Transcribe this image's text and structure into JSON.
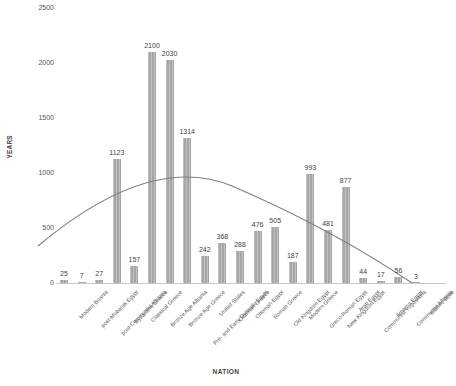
{
  "chart_data": {
    "type": "bar",
    "title": "",
    "xlabel": "NATION",
    "ylabel": "YEARS",
    "ylim": [
      0,
      2500
    ],
    "yticks": [
      0,
      500,
      1000,
      1500,
      2000,
      2500
    ],
    "grid": false,
    "legend": null,
    "bar_color": "#a6a6a6",
    "trendline": {
      "present": true,
      "shape": "downward-parabola",
      "color": "#7f7f7f",
      "description": "polynomial trendline rising from left, peaking near Ottoman Egypt, descending to baseline near Communist Albania"
    },
    "categories": [
      "Modern Bosnia",
      "post-Mubarak Egypt",
      "post-Communist Albania",
      "Byzantine Greece",
      "Classical Greece",
      "Bronze Age Albania",
      "Bronze Age Greece",
      "Pre- and Early Dynastic Egypt",
      "United States",
      "Ottoman Greece",
      "Ottoman Egypt",
      "Roman Greece",
      "Old Kingdom Egypt",
      "Modern Greece",
      "Greco-Roman Egypt",
      "New Kingdom Egypt",
      "Arab Egypt",
      "Communist Yugoslavia",
      "Amarna Egypt",
      "Communist Albania",
      "Islamic State"
    ],
    "values": [
      25,
      7,
      27,
      1123,
      157,
      2100,
      2030,
      1314,
      242,
      368,
      288,
      476,
      505,
      187,
      993,
      481,
      877,
      44,
      17,
      56,
      3
    ]
  }
}
